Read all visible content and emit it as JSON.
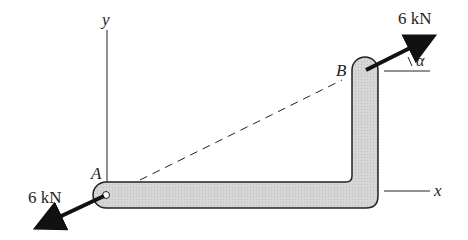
{
  "labels": {
    "y_axis": "y",
    "x_axis": "x",
    "point_a": "A",
    "point_b": "B",
    "angle": "α",
    "force_a": "6 kN",
    "force_b": "6 kN"
  },
  "colors": {
    "member_fill": "#d4d4d4",
    "stroke": "#222222"
  }
}
